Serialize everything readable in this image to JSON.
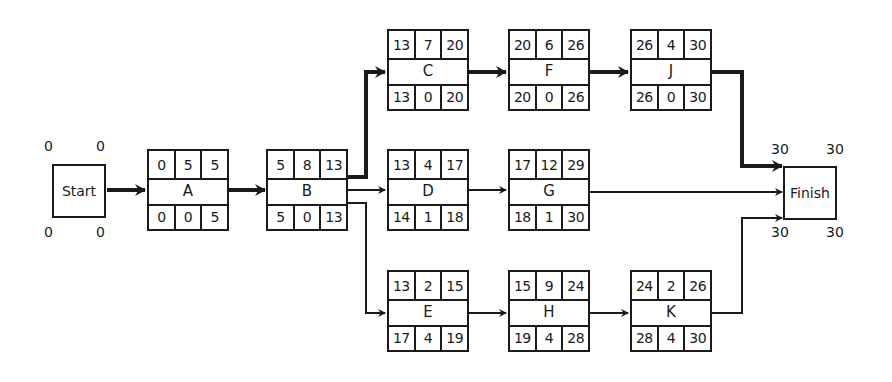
{
  "diagram": {
    "type": "activity-on-node network (critical path)",
    "start": {
      "label": "Start",
      "es": "0",
      "ef": "0",
      "ls": "0",
      "lf": "0"
    },
    "finish": {
      "label": "Finish",
      "es": "30",
      "ef": "30",
      "ls": "30",
      "lf": "30"
    },
    "nodes": {
      "A": {
        "label": "A",
        "es": "0",
        "dur": "5",
        "ef": "5",
        "ls": "0",
        "slack": "0",
        "lf": "5",
        "critical": true
      },
      "B": {
        "label": "B",
        "es": "5",
        "dur": "8",
        "ef": "13",
        "ls": "5",
        "slack": "0",
        "lf": "13",
        "critical": true
      },
      "C": {
        "label": "C",
        "es": "13",
        "dur": "7",
        "ef": "20",
        "ls": "13",
        "slack": "0",
        "lf": "20",
        "critical": true
      },
      "D": {
        "label": "D",
        "es": "13",
        "dur": "4",
        "ef": "17",
        "ls": "14",
        "slack": "1",
        "lf": "18",
        "critical": false
      },
      "E": {
        "label": "E",
        "es": "13",
        "dur": "2",
        "ef": "15",
        "ls": "17",
        "slack": "4",
        "lf": "19",
        "critical": false
      },
      "F": {
        "label": "F",
        "es": "20",
        "dur": "6",
        "ef": "26",
        "ls": "20",
        "slack": "0",
        "lf": "26",
        "critical": true
      },
      "G": {
        "label": "G",
        "es": "17",
        "dur": "12",
        "ef": "29",
        "ls": "18",
        "slack": "1",
        "lf": "30",
        "critical": false
      },
      "H": {
        "label": "H",
        "es": "15",
        "dur": "9",
        "ef": "24",
        "ls": "19",
        "slack": "4",
        "lf": "28",
        "critical": false
      },
      "J": {
        "label": "J",
        "es": "26",
        "dur": "4",
        "ef": "30",
        "ls": "26",
        "slack": "0",
        "lf": "30",
        "critical": true
      },
      "K": {
        "label": "K",
        "es": "24",
        "dur": "2",
        "ef": "26",
        "ls": "28",
        "slack": "4",
        "lf": "30",
        "critical": false
      }
    },
    "edges": [
      {
        "from": "Start",
        "to": "A",
        "critical": true
      },
      {
        "from": "A",
        "to": "B",
        "critical": true
      },
      {
        "from": "B",
        "to": "C",
        "critical": true
      },
      {
        "from": "B",
        "to": "D",
        "critical": false
      },
      {
        "from": "B",
        "to": "E",
        "critical": false
      },
      {
        "from": "C",
        "to": "F",
        "critical": true
      },
      {
        "from": "F",
        "to": "J",
        "critical": true
      },
      {
        "from": "D",
        "to": "G",
        "critical": false
      },
      {
        "from": "E",
        "to": "H",
        "critical": false
      },
      {
        "from": "H",
        "to": "K",
        "critical": false
      },
      {
        "from": "J",
        "to": "Finish",
        "critical": true
      },
      {
        "from": "G",
        "to": "Finish",
        "critical": false
      },
      {
        "from": "K",
        "to": "Finish",
        "critical": false
      }
    ],
    "colors": {
      "line": "#1a1a1a",
      "background": "#ffffff"
    }
  }
}
